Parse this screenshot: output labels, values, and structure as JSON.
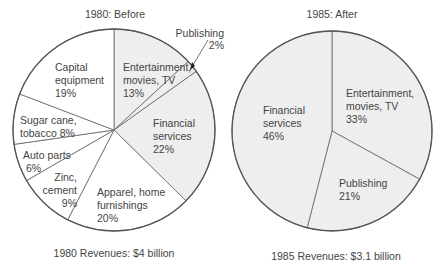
{
  "chart_data": [
    {
      "type": "pie",
      "title": "1980: Before",
      "caption": "1980 Revenues: $4 billion",
      "start_angle": "top, clockwise",
      "slices": [
        {
          "label": "Entertainment, movies, TV",
          "value": 13,
          "shaded": true
        },
        {
          "label": "Publishing",
          "value": 2,
          "shaded": true
        },
        {
          "label": "Financial services",
          "value": 22,
          "shaded": true
        },
        {
          "label": "Apparel, home furnishings",
          "value": 20,
          "shaded": false
        },
        {
          "label": "Zinc, cement",
          "value": 9,
          "shaded": false
        },
        {
          "label": "Auto parts",
          "value": 6,
          "shaded": false
        },
        {
          "label": "Sugar cane, tobacco",
          "value": 8,
          "shaded": false
        },
        {
          "label": "Capital equipment",
          "value": 19,
          "shaded": false
        }
      ]
    },
    {
      "type": "pie",
      "title": "1985: After",
      "caption": "1985 Revenues: $3.1 billion",
      "start_angle": "top, clockwise",
      "slices": [
        {
          "label": "Entertainment, movies, TV",
          "value": 33,
          "shaded": true
        },
        {
          "label": "Publishing",
          "value": 21,
          "shaded": true
        },
        {
          "label": "Financial services",
          "value": 46,
          "shaded": true
        }
      ]
    }
  ],
  "colors": {
    "shaded": "#eeeeee",
    "unshaded": "#ffffff",
    "stroke": "#555555",
    "text": "#444444"
  },
  "left": {
    "title": "1980: Before",
    "caption": "1980 Revenues: $4 billion",
    "labels": {
      "ent": [
        "Entertainment,",
        "movies, TV",
        "13%"
      ],
      "pub": [
        "Publishing",
        "2%"
      ],
      "fin": [
        "Financial",
        "services",
        "22%"
      ],
      "app": [
        "Apparel, home",
        "furnishings",
        "20%"
      ],
      "zinc": [
        "Zinc,",
        "cement",
        "9%"
      ],
      "auto": [
        "Auto parts",
        "6%"
      ],
      "sugar": [
        "Sugar cane,",
        "tobacco 8%"
      ],
      "cap": [
        "Capital",
        "equipment",
        "19%"
      ]
    }
  },
  "right": {
    "title": "1985: After",
    "caption": "1985 Revenues: $3.1 billion",
    "labels": {
      "ent": [
        "Entertainment,",
        "movies, TV",
        "33%"
      ],
      "pub": [
        "Publishing",
        "21%"
      ],
      "fin": [
        "Financial",
        "services",
        "46%"
      ]
    }
  }
}
